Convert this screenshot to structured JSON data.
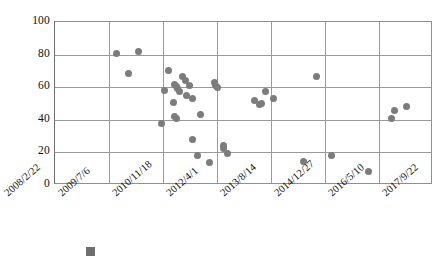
{
  "chart_data": {
    "type": "scatter",
    "title": "",
    "xlabel": "",
    "ylabel": "",
    "ylim": [
      0,
      100
    ],
    "yticks": [
      0,
      20,
      40,
      60,
      80,
      100
    ],
    "xticks": [
      "2008/2/22",
      "2009/7/6",
      "2010/11/18",
      "2012/4/1",
      "2013/8/14",
      "2014/12/27",
      "2016/5/10",
      "2017/9/22"
    ],
    "grid": true,
    "legend_position": "bottom",
    "series": [
      {
        "name": "",
        "marker": "circle",
        "color": "#7c7c7c",
        "points": [
          {
            "x": "2009/8/20",
            "y": 80.5
          },
          {
            "x": "2009/11/15",
            "y": 68.5
          },
          {
            "x": "2010/1/24",
            "y": 82.0
          },
          {
            "x": "2010/10/6",
            "y": 57.8
          },
          {
            "x": "2010/10/28",
            "y": 37.8
          },
          {
            "x": "2010/12/10",
            "y": 70.0
          },
          {
            "x": "2011/1/14",
            "y": 50.5
          },
          {
            "x": "2011/1/28",
            "y": 61.8
          },
          {
            "x": "2011/2/6",
            "y": 60.2
          },
          {
            "x": "2011/2/12",
            "y": 59.0
          },
          {
            "x": "2011/2/20",
            "y": 41.8
          },
          {
            "x": "2011/2/24",
            "y": 41.0
          },
          {
            "x": "2011/4/2",
            "y": 66.5
          },
          {
            "x": "2011/4/10",
            "y": 64.0
          },
          {
            "x": "2011/5/6",
            "y": 55.0
          },
          {
            "x": "2011/6/14",
            "y": 61.0
          },
          {
            "x": "2011/6/28",
            "y": 57.5
          },
          {
            "x": "2011/7/20",
            "y": 52.8
          },
          {
            "x": "2011/9/6",
            "y": 28.2
          },
          {
            "x": "2011/10/18",
            "y": 43.5
          },
          {
            "x": "2011/11/26",
            "y": 18.0
          },
          {
            "x": "2012/2/10",
            "y": 14.0
          },
          {
            "x": "2012/3/20",
            "y": 62.8
          },
          {
            "x": "2012/3/28",
            "y": 60.8
          },
          {
            "x": "2012/4/2",
            "y": 59.8
          },
          {
            "x": "2012/5/10",
            "y": 24.0
          },
          {
            "x": "2012/5/24",
            "y": 22.5
          },
          {
            "x": "2012/6/14",
            "y": 19.5
          },
          {
            "x": "2013/5/12",
            "y": 51.8
          },
          {
            "x": "2013/7/18",
            "y": 49.5
          },
          {
            "x": "2013/7/28",
            "y": 50.0
          },
          {
            "x": "2013/8/16",
            "y": 57.5
          },
          {
            "x": "2013/9/26",
            "y": 53.0
          },
          {
            "x": "2014/4/20",
            "y": 14.5
          },
          {
            "x": "2014/9/8",
            "y": 66.5
          },
          {
            "x": "2015/2/14",
            "y": 18.0
          },
          {
            "x": "2016/2/20",
            "y": 8.0
          },
          {
            "x": "2016/8/6",
            "y": 40.5
          },
          {
            "x": "2016/8/24",
            "y": 46.0
          },
          {
            "x": "2017/1/10",
            "y": 48.0
          }
        ],
        "pixel_points": [
          [
            115,
            80.5
          ],
          [
            127,
            68.5
          ],
          [
            137,
            82.0
          ],
          [
            163,
            57.8
          ],
          [
            160,
            37.8
          ],
          [
            167,
            70.0
          ],
          [
            172,
            50.5
          ],
          [
            173,
            61.8
          ],
          [
            175,
            60.2
          ],
          [
            176,
            59.0
          ],
          [
            173,
            41.8
          ],
          [
            175,
            41.0
          ],
          [
            181,
            66.5
          ],
          [
            184,
            64.0
          ],
          [
            185,
            55.0
          ],
          [
            188,
            61.0
          ],
          [
            178,
            57.5
          ],
          [
            191,
            52.8
          ],
          [
            191,
            28.2
          ],
          [
            199,
            43.5
          ],
          [
            196,
            18.0
          ],
          [
            208,
            14.0
          ],
          [
            213,
            62.8
          ],
          [
            214,
            60.8
          ],
          [
            216,
            59.8
          ],
          [
            222,
            24.0
          ],
          [
            222,
            22.5
          ],
          [
            226,
            19.5
          ],
          [
            253,
            51.8
          ],
          [
            258,
            49.5
          ],
          [
            260,
            50.0
          ],
          [
            264,
            57.5
          ],
          [
            272,
            53.0
          ],
          [
            302,
            14.5
          ],
          [
            315,
            66.5
          ],
          [
            330,
            18.0
          ],
          [
            367,
            8.0
          ],
          [
            390,
            40.5
          ],
          [
            393,
            46.0
          ],
          [
            405,
            48.0
          ]
        ]
      }
    ]
  },
  "axis": {
    "x_domain_start": "2008/2/22",
    "x_domain_end": "2017/9/22"
  },
  "legend": {
    "label": ""
  }
}
